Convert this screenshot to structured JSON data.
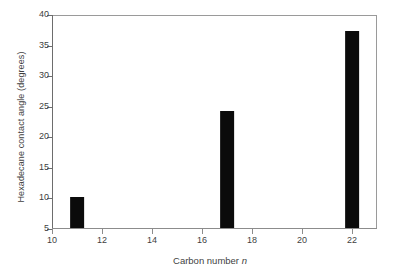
{
  "chart_data": {
    "type": "bar",
    "title": "",
    "xlabel": "Carbon number n",
    "xlabel_italic_part": "n",
    "xlabel_plain_part": "Carbon number ",
    "ylabel": "Hexadecane contact angle (degrees)",
    "categories": [
      11,
      17,
      22
    ],
    "values": [
      10.0,
      24.2,
      37.3
    ],
    "series": [
      {
        "name": "Hexadecane contact angle",
        "values": [
          10.0,
          24.2,
          37.3
        ]
      }
    ],
    "xlim": [
      10,
      23
    ],
    "ylim": [
      5,
      40
    ],
    "xticks": [
      10,
      12,
      14,
      16,
      18,
      20,
      22
    ],
    "xtick_labels": [
      "10",
      "12",
      "14",
      "16",
      "18",
      "20",
      "22"
    ],
    "yticks": [
      5,
      10,
      15,
      20,
      25,
      30,
      35,
      40
    ],
    "ytick_labels": [
      "5",
      "10",
      "15",
      "20",
      "25",
      "30",
      "35",
      "40"
    ],
    "grid": false,
    "legend": false,
    "legend_position": "none",
    "bar_color": "#0b0b0b",
    "bar_width": 0.55,
    "frame_color": "#8c8c8c",
    "background": "#ffffff"
  }
}
